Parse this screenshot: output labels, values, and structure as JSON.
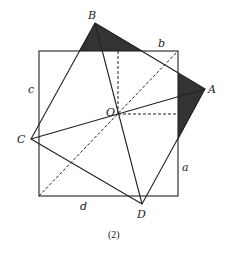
{
  "figure": {
    "caption": "(2)",
    "colors": {
      "stroke": "#222222",
      "shade": "#333333",
      "background": "#ffffff"
    }
  },
  "points": {
    "A": {
      "label": "A",
      "x": 205,
      "y": 89
    },
    "B": {
      "label": "B",
      "x": 95,
      "y": 23
    },
    "C": {
      "label": "C",
      "x": 31,
      "y": 139
    },
    "D": {
      "label": "D",
      "x": 142,
      "y": 204
    },
    "O": {
      "label": "O",
      "x": 118,
      "y": 114
    }
  },
  "square": {
    "x1": 39,
    "y1": 51,
    "x2": 178,
    "y2": 196
  },
  "side_labels": {
    "a": "a",
    "b": "b",
    "c": "c",
    "d": "d"
  }
}
